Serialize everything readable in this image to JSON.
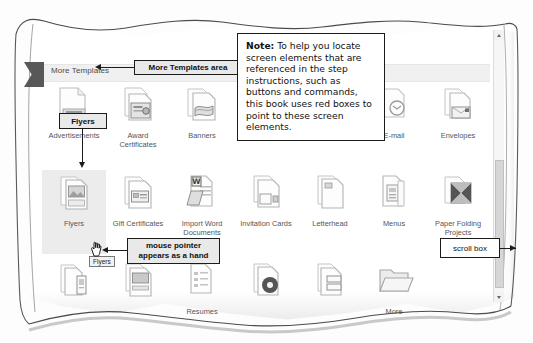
{
  "figure": {
    "note": {
      "lead_label": "Note:",
      "body": " To help you locate screen elements that are referenced in the step instructions, such as buttons and commands, this book uses red boxes to point to these screen elements."
    },
    "callouts": [
      {
        "id": "more-templates-area",
        "label": "More Templates area"
      },
      {
        "id": "flyers-box",
        "label": "Flyers"
      },
      {
        "id": "mouse-pointer",
        "label": "mouse pointer\nappears as a hand"
      },
      {
        "id": "scroll-box",
        "label": "scroll box"
      }
    ],
    "tooltip": {
      "label": "Flyers"
    }
  },
  "gallery": {
    "section_header": "More Templates",
    "selected_item": "Flyers",
    "rows": [
      {
        "items": [
          {
            "label": "Advertisements",
            "icon": "documents-stack-icon"
          },
          {
            "label": "Award\nCertificates",
            "icon": "award-certificate-icon"
          },
          {
            "label": "Banners",
            "icon": "banner-icon"
          },
          {
            "label": "Business Forms",
            "icon": "business-form-icon"
          },
          {
            "label": "Catalogs",
            "icon": "catalog-icon"
          },
          {
            "label": "E-mail",
            "icon": "email-icon"
          },
          {
            "label": "Envelopes",
            "icon": "envelope-icon"
          }
        ]
      },
      {
        "items": [
          {
            "label": "Flyers",
            "icon": "flyer-icon",
            "selected": true
          },
          {
            "label": "Gift Certificates",
            "icon": "gift-certificate-icon"
          },
          {
            "label": "Import Word\nDocuments",
            "icon": "import-word-icon"
          },
          {
            "label": "Invitation Cards",
            "icon": "invitation-card-icon"
          },
          {
            "label": "Letterhead",
            "icon": "letterhead-icon"
          },
          {
            "label": "Menus",
            "icon": "menu-icon"
          },
          {
            "label": "Paper Folding\nProjects",
            "icon": "paper-folding-icon"
          }
        ]
      },
      {
        "items": [
          {
            "label": "",
            "icon": "programs-icon"
          },
          {
            "label": "",
            "icon": "postcards-icon"
          },
          {
            "label": "Resumes",
            "icon": "resume-icon"
          },
          {
            "label": "",
            "icon": "cd-label-icon"
          },
          {
            "label": "",
            "icon": "labels-icon"
          },
          {
            "label": "More",
            "icon": "folder-icon"
          }
        ]
      }
    ]
  },
  "scrollbar": {
    "up_arrow": "scroll-up-arrow",
    "down_arrow": "scroll-down-arrow",
    "thumb": "scroll-box"
  },
  "colors": {
    "callout_fill": "#e9e9e9",
    "callout_border": "#1b1b1b",
    "band": "#f0f0f0",
    "selection": "#ececec",
    "tab": "#585858"
  }
}
